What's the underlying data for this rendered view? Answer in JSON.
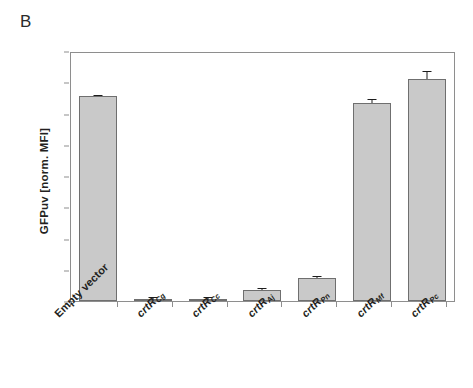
{
  "panel": {
    "label": "B"
  },
  "chart_data": {
    "type": "bar",
    "title": "",
    "xlabel": "",
    "ylabel": "GFPuv [norm. MFI]",
    "ylim": [
      0,
      1.6
    ],
    "ytick_labels": [
      "1.6",
      "1.4",
      "1.2",
      "1.0",
      "0.8",
      "0.6",
      "0.4",
      "0.2",
      "0"
    ],
    "ytick_values": [
      1.6,
      1.4,
      1.2,
      1.0,
      0.8,
      0.6,
      0.4,
      0.2,
      0
    ],
    "grid": false,
    "legend": false,
    "bar_color": "#c9c9c9",
    "bar_edge_color": "#6f6f6f",
    "categories": [
      "Empty vector",
      "crtR_Cg",
      "crtR_Cc",
      "crtR_Aj",
      "crtR_Pn",
      "crtR_Mf",
      "crtR_Pc"
    ],
    "category_parts": [
      {
        "base": "Empty vector",
        "sub": "",
        "italic": false
      },
      {
        "base": "crtR",
        "sub": "Cg",
        "italic": true
      },
      {
        "base": "crtR",
        "sub": "Cc",
        "italic": true
      },
      {
        "base": "crtR",
        "sub": "Aj",
        "italic": true
      },
      {
        "base": "crtR",
        "sub": "Pn",
        "italic": true
      },
      {
        "base": "crtR",
        "sub": "Mf",
        "italic": true
      },
      {
        "base": "crtR",
        "sub": "Pc",
        "italic": true
      }
    ],
    "values": [
      1.31,
      0.01,
      0.015,
      0.07,
      0.15,
      1.27,
      1.42
    ],
    "errors": [
      0.01,
      0.004,
      0.006,
      0.012,
      0.012,
      0.025,
      0.05
    ]
  }
}
